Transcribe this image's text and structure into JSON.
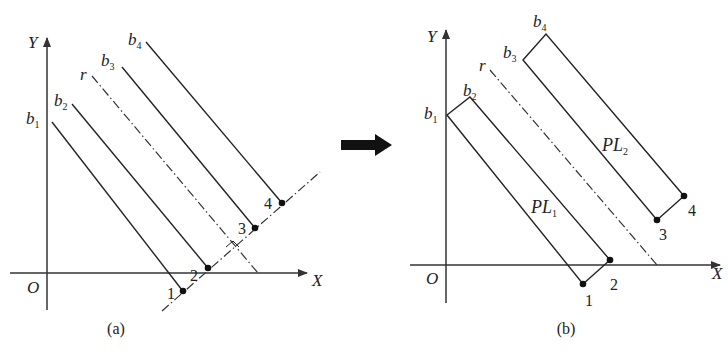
{
  "panel_a": {
    "caption": "(a)",
    "axis_x": "X",
    "axis_y": "Y",
    "origin": "O",
    "line_labels": [
      {
        "base": "b",
        "sub": "1"
      },
      {
        "base": "b",
        "sub": "2"
      },
      {
        "base": "r",
        "sub": ""
      },
      {
        "base": "b",
        "sub": "3"
      },
      {
        "base": "b",
        "sub": "4"
      }
    ],
    "points": [
      "1",
      "2",
      "3",
      "4"
    ]
  },
  "panel_b": {
    "caption": "(b)",
    "axis_x": "X",
    "axis_y": "Y",
    "origin": "O",
    "line_labels": [
      {
        "base": "b",
        "sub": "1"
      },
      {
        "base": "b",
        "sub": "2"
      },
      {
        "base": "r",
        "sub": ""
      },
      {
        "base": "b",
        "sub": "3"
      },
      {
        "base": "b",
        "sub": "4"
      }
    ],
    "points": [
      "1",
      "2",
      "3",
      "4"
    ],
    "regions": [
      {
        "base": "PL",
        "sub": "1"
      },
      {
        "base": "PL",
        "sub": "2"
      }
    ]
  },
  "transition": {
    "icon": "right-arrow-icon"
  },
  "colors": {
    "stroke": "#222222",
    "background": "#ffffff"
  }
}
